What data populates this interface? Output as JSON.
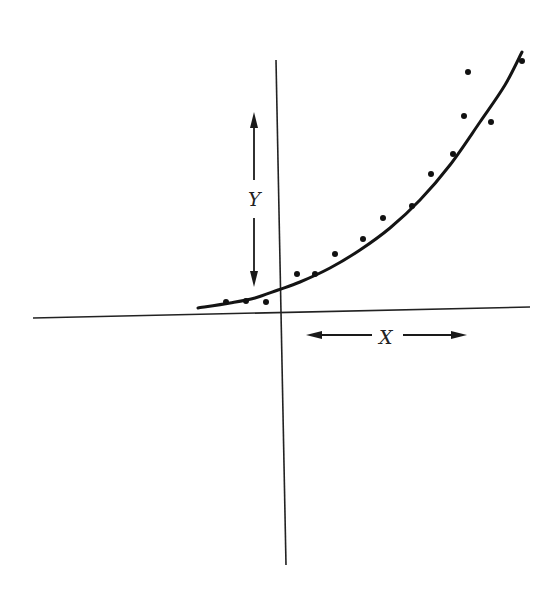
{
  "figure": {
    "type": "scatter-with-fitted-curve",
    "labels": {
      "y": "Y",
      "x": "X"
    },
    "colors": {
      "background": "#ffffff",
      "ink": "#141414"
    }
  },
  "chart_data": {
    "type": "scatter",
    "title": "",
    "xlabel": "X",
    "ylabel": "Y",
    "grid": false,
    "legend": null,
    "axis_pixels": {
      "horizontal": {
        "x1": 33,
        "y1": 318,
        "x2": 530,
        "y2": 307
      },
      "vertical": {
        "x1": 276,
        "y1": 60,
        "x2": 286,
        "y2": 565
      }
    },
    "fit_curve_pixels": [
      [
        198,
        308
      ],
      [
        230,
        303
      ],
      [
        255,
        298
      ],
      [
        278,
        290
      ],
      [
        300,
        282
      ],
      [
        330,
        268
      ],
      [
        360,
        250
      ],
      [
        390,
        228
      ],
      [
        420,
        200
      ],
      [
        450,
        165
      ],
      [
        480,
        122
      ],
      [
        505,
        85
      ],
      [
        522,
        52
      ]
    ],
    "points_pixels": [
      [
        226,
        302
      ],
      [
        246,
        301
      ],
      [
        266,
        302
      ],
      [
        297,
        274
      ],
      [
        315,
        274
      ],
      [
        335,
        254
      ],
      [
        363,
        239
      ],
      [
        383,
        218
      ],
      [
        412,
        206
      ],
      [
        431,
        174
      ],
      [
        453,
        154
      ],
      [
        464,
        116
      ],
      [
        491,
        122
      ],
      [
        468,
        72
      ],
      [
        522,
        61
      ]
    ],
    "y_arrow_pixels": {
      "x": 254,
      "top": 112,
      "bottom": 287
    },
    "x_arrow_pixels": {
      "y": 335,
      "left": 306,
      "right": 467
    }
  }
}
